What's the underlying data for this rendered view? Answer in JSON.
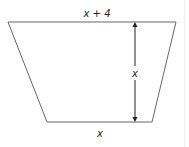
{
  "figure": {
    "shape": "trapezoid",
    "labels": {
      "top": "x + 4",
      "height": "x",
      "bottom": "x"
    },
    "colors": {
      "stroke": "#555555",
      "arrow": "#222222",
      "text": "#222222"
    }
  }
}
